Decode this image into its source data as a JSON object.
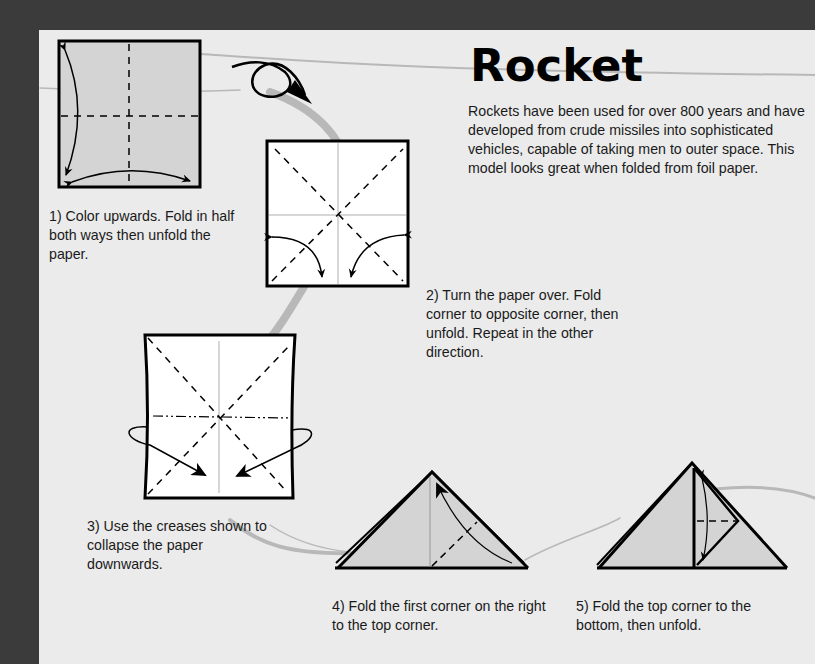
{
  "title": "Rocket",
  "intro": "Rockets have been used for over 800 years and have developed from crude missiles into sophisticated vehicles, capable of taking men to outer space. This model looks great when folded from foil paper.",
  "steps": [
    {
      "number": 1,
      "caption": "1) Color upwards. Fold in half both ways then unfold the paper.",
      "diagram": "square-folded-in-half-icon"
    },
    {
      "number": 2,
      "caption": "2) Turn the paper over. Fold corner to opposite corner, then unfold. Repeat in the other direction.",
      "diagram": "square-diagonal-folds-icon"
    },
    {
      "number": 3,
      "caption": "3) Use the creases shown to collapse the paper downwards.",
      "diagram": "square-collapse-icon"
    },
    {
      "number": 4,
      "caption": "4) Fold the first corner on the right to the top corner.",
      "diagram": "triangle-fold-corner-icon"
    },
    {
      "number": 5,
      "caption": "5) Fold the top corner to the bottom, then unfold.",
      "diagram": "triangle-fold-top-icon"
    }
  ],
  "colors": {
    "background": "#3b3b3b",
    "paper": "#ebebeb",
    "paper_colored_side": "#d4d4d4",
    "paper_white_side": "#ffffff",
    "swoosh": "#b5b5b5",
    "ink": "#000000"
  }
}
